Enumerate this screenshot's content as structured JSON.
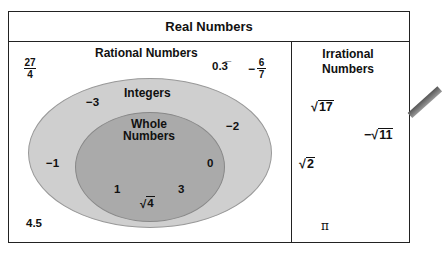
{
  "title": "Real Numbers",
  "rational": {
    "label": "Rational Numbers",
    "examples": {
      "frac_27_4": {
        "num": "27",
        "den": "4"
      },
      "repeating": "0.3̅",
      "neg_frac": {
        "sign": "−",
        "num": "6",
        "den": "7"
      },
      "decimal": "4.5"
    }
  },
  "integers": {
    "label": "Integers",
    "examples": [
      "−3",
      "−2",
      "−1"
    ]
  },
  "whole": {
    "label_line1": "Whole",
    "label_line2": "Numbers",
    "examples": [
      "0",
      "1",
      "3"
    ],
    "sqrt4": "4"
  },
  "irrational": {
    "label_line1": "Irrational",
    "label_line2": "Numbers",
    "sqrt17": "17",
    "neg_sqrt11_sign": "−",
    "neg_sqrt11": "11",
    "sqrt2": "2",
    "pi": "π"
  },
  "colors": {
    "integers_fill": "#cfcfcf",
    "whole_fill": "#aaaaaa",
    "border": "#222222"
  }
}
